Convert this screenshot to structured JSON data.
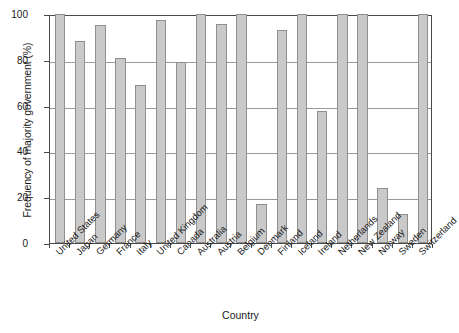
{
  "chart_data": {
    "type": "bar",
    "title": "",
    "xlabel": "Country",
    "ylabel": "Frequency of majority government (%)",
    "ylim": [
      0,
      100
    ],
    "yticks": [
      0,
      20,
      40,
      60,
      80,
      100
    ],
    "ytick_labels": [
      "0",
      "20",
      "40",
      "60",
      "80",
      "100"
    ],
    "grid": true,
    "grid_axis": "y",
    "legend": false,
    "legend_position": "none",
    "bar_color": "#c9c9c9",
    "bar_edge_color": "#8f8f8f",
    "axis_color": "#4a4a4a",
    "background_color": "#ffffff",
    "categories": [
      "United States",
      "Japan",
      "Germany",
      "France",
      "Italy",
      "United Kingdom",
      "Canada",
      "Australia",
      "Austria",
      "Belgium",
      "Denmark",
      "Finland",
      "Iceland",
      "Ireland",
      "Netherlands",
      "New Zealand",
      "Norway",
      "Sweden",
      "Switzerland"
    ],
    "values": [
      100,
      88,
      95,
      81,
      69,
      97.5,
      79,
      100,
      95.5,
      100,
      17,
      93,
      100,
      57.5,
      100,
      100,
      24,
      12.5,
      100
    ]
  },
  "axis": {
    "y_title": "Frequency of majority government (%)",
    "x_title": "Country"
  }
}
